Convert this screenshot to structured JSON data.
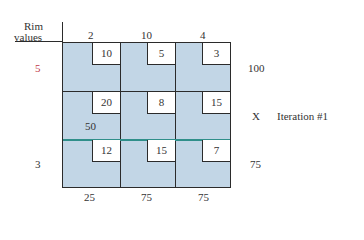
{
  "header": {
    "rim_label_line1": "Rim",
    "rim_label_line2": "values"
  },
  "columns": {
    "rim_values": [
      "2",
      "10",
      "4"
    ],
    "demands": [
      "25",
      "75",
      "75"
    ]
  },
  "rows": {
    "rim_values": [
      "5",
      "",
      "3"
    ],
    "supplies": [
      "100",
      "X",
      "75"
    ]
  },
  "cells": [
    [
      "10",
      "5",
      "3"
    ],
    [
      "20",
      "8",
      "15"
    ],
    [
      "12",
      "15",
      "7"
    ]
  ],
  "allocations": {
    "row1_col1": "50"
  },
  "annotation": {
    "iteration": "Iteration #1"
  },
  "colors": {
    "cell_fill": "#c2d6e6",
    "cost_box": "#ffffff",
    "grid_line": "#2b2b2b",
    "highlight_line": "#2f8f8a",
    "rim_value_red": "#c0394a"
  }
}
